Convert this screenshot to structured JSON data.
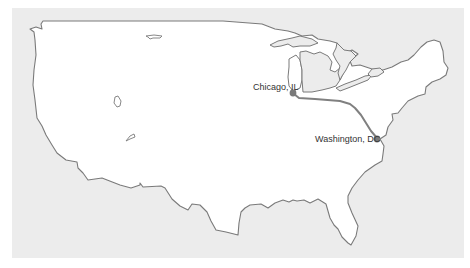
{
  "map": {
    "title": "",
    "colors": {
      "background": "#ececec",
      "land": "#ffffff",
      "border": "#7a7a7a",
      "route": "#808080",
      "marker": "#7a7a7a"
    },
    "cities": [
      {
        "name": "Chicago, IL"
      },
      {
        "name": "Washington, DC"
      }
    ],
    "route": {
      "from": "Chicago, IL",
      "to": "Washington, DC"
    }
  }
}
